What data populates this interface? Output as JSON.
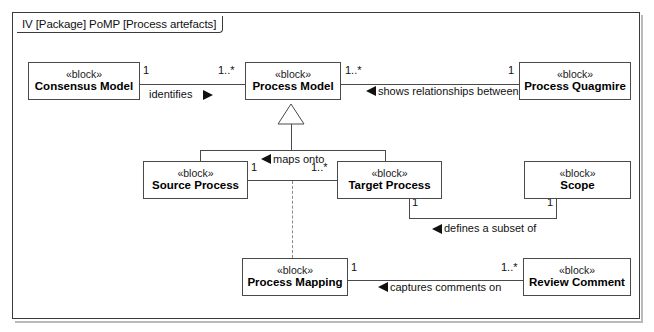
{
  "diagram": {
    "frame_label_prefix": "IV",
    "frame_label": "IV [Package] PoMP [Process artefacts]",
    "notation": "SysML Block Definition Diagram",
    "line_color": "#4a4a4a",
    "text_color": "#111111",
    "background": "#ffffff"
  },
  "blocks": [
    {
      "id": "consensus-model",
      "stereotype": "«left»",
      "stereo": "«block»",
      "name": "Consensus Model"
    },
    {
      "id": "process-model",
      "stereo": "«block»",
      "name": "Process Model"
    },
    {
      "id": "process-quagmire",
      "stereo": "«block»",
      "name": "Process Quagmire"
    },
    {
      "id": "source-process",
      "stereo": "«block»",
      "name": "Source Process"
    },
    {
      "id": "target-process",
      "stereo": "«block»",
      "name": "Target Process"
    },
    {
      "id": "scope",
      "stereo": "«block»",
      "name": "Scope"
    },
    {
      "id": "process-mapping",
      "stereo": "«block»",
      "name": "Process Mapping"
    },
    {
      "id": "review-comment",
      "stereo": "«block»",
      "name": "Review Comment"
    }
  ],
  "relationships": [
    {
      "id": "identifies",
      "label": "identifies",
      "source": "Consensus Model",
      "target": "Process Model",
      "source_mult": "1",
      "target_mult": "1..*",
      "arrow": "right"
    },
    {
      "id": "shows-relationships",
      "label": "shows relationships between",
      "source": "Process Model",
      "target": "Process Quagmire",
      "source_mult": "1..*",
      "target_mult": "1",
      "arrow": "left"
    },
    {
      "id": "maps-onto",
      "label": "maps onto",
      "source": "Source Process",
      "target": "Target Process",
      "source_mult": "1",
      "target_mult": "1..*",
      "arrow": "left"
    },
    {
      "id": "defines-subset",
      "label": "defines a subset of",
      "source": "Target Process",
      "target": "Scope",
      "source_mult": "1",
      "target_mult": "1",
      "arrow": "left"
    },
    {
      "id": "captures-comments",
      "label": "captures comments on",
      "source": "Process Mapping",
      "target": "Review Comment",
      "source_mult": "1",
      "target_mult": "1..*",
      "arrow": "left"
    }
  ],
  "generalizations": [
    {
      "id": "gen-source",
      "parent": "Process Model",
      "child": "Source Process"
    },
    {
      "id": "gen-target",
      "parent": "Process Model",
      "child": "Target Process"
    }
  ],
  "dependencies": [
    {
      "id": "dep-mapping",
      "from": "maps-onto",
      "to": "Process Mapping",
      "style": "dashed"
    }
  ],
  "multiplicities": {
    "consensus_right": "1",
    "process_model_left": "1..*",
    "process_model_right": "1..*",
    "quagmire_left": "1",
    "source_right": "1",
    "target_left": "1..*",
    "target_bottom": "1",
    "scope_bottom": "1",
    "mapping_right": "1",
    "review_left": "1..*"
  },
  "labels": {
    "identifies": "identifies",
    "shows_relationships_between": "shows relationships between",
    "maps_onto": "maps onto",
    "defines_a_subset_of": "defines a subset of",
    "captures_comments_on": "captures comments on"
  }
}
